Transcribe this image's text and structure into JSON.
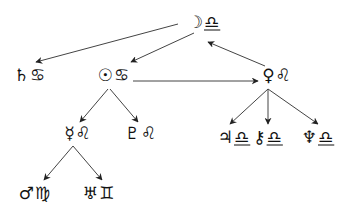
{
  "diagram": {
    "type": "astrological-dispositor-tree",
    "colors": {
      "line": "#444444",
      "glyph": "#111111",
      "background": "#ffffff"
    },
    "nodes": [
      {
        "id": "moon-libra",
        "planet": "☽",
        "planet_name": "Moon",
        "sign": "♎",
        "sign_name": "Libra",
        "x": 204,
        "y": 22,
        "underline": true
      },
      {
        "id": "saturn-cancer",
        "planet": "♄",
        "planet_name": "Saturn",
        "sign": "♋",
        "sign_name": "Cancer",
        "x": 30,
        "y": 75,
        "underline": false
      },
      {
        "id": "sun-cancer",
        "planet": "☉",
        "planet_name": "Sun",
        "sign": "♋",
        "sign_name": "Cancer",
        "x": 114,
        "y": 75,
        "underline": false
      },
      {
        "id": "venus-leo",
        "planet": "♀",
        "planet_name": "Venus",
        "sign": "♌",
        "sign_name": "Leo",
        "x": 277,
        "y": 75,
        "underline": false
      },
      {
        "id": "mercury-leo",
        "planet": "☿",
        "planet_name": "Mercury",
        "sign": "♌",
        "sign_name": "Leo",
        "x": 78,
        "y": 133,
        "underline": false
      },
      {
        "id": "pluto-leo",
        "planet": "♇",
        "planet_name": "Pluto",
        "sign": "♌",
        "sign_name": "Leo",
        "x": 141,
        "y": 133,
        "underline": false
      },
      {
        "id": "jupiter-libra",
        "planet": "♃",
        "planet_name": "Jupiter",
        "sign": "♎",
        "sign_name": "Libra",
        "x": 234,
        "y": 137,
        "underline": true
      },
      {
        "id": "chiron-libra",
        "planet": "⚷",
        "planet_name": "Chiron",
        "sign": "♎",
        "sign_name": "Libra",
        "x": 268,
        "y": 137,
        "underline": true
      },
      {
        "id": "neptune-libra",
        "planet": "♆",
        "planet_name": "Neptune",
        "sign": "♎",
        "sign_name": "Libra",
        "x": 318,
        "y": 137,
        "underline": true
      },
      {
        "id": "mars-virgo",
        "planet": "♂",
        "planet_name": "Mars",
        "sign": "♍",
        "sign_name": "Virgo",
        "x": 35,
        "y": 193,
        "underline": false
      },
      {
        "id": "uranus-gemini",
        "planet": "♅",
        "planet_name": "Uranus",
        "sign": "♊",
        "sign_name": "Gemini",
        "x": 99,
        "y": 193,
        "underline": false
      }
    ],
    "edges": [
      {
        "from": "moon-libra",
        "to": "saturn-cancer",
        "x1": 178,
        "y1": 24,
        "x2": 36,
        "y2": 62
      },
      {
        "from": "moon-libra",
        "to": "sun-cancer",
        "x1": 194,
        "y1": 33,
        "x2": 131,
        "y2": 62
      },
      {
        "from": "venus-leo",
        "to": "moon-libra",
        "x1": 265,
        "y1": 66,
        "x2": 208,
        "y2": 42
      },
      {
        "from": "sun-cancer",
        "to": "venus-leo",
        "x1": 133,
        "y1": 81,
        "x2": 258,
        "y2": 81
      },
      {
        "from": "sun-cancer",
        "to": "mercury-leo",
        "x1": 108,
        "y1": 89,
        "x2": 80,
        "y2": 122
      },
      {
        "from": "sun-cancer",
        "to": "pluto-leo",
        "x1": 110,
        "y1": 89,
        "x2": 138,
        "y2": 122
      },
      {
        "from": "venus-leo",
        "to": "jupiter-libra",
        "x1": 268,
        "y1": 89,
        "x2": 230,
        "y2": 124
      },
      {
        "from": "venus-leo",
        "to": "chiron-libra",
        "x1": 268,
        "y1": 89,
        "x2": 268,
        "y2": 124
      },
      {
        "from": "venus-leo",
        "to": "neptune-libra",
        "x1": 268,
        "y1": 89,
        "x2": 318,
        "y2": 124
      },
      {
        "from": "mercury-leo",
        "to": "mars-virgo",
        "x1": 73,
        "y1": 146,
        "x2": 44,
        "y2": 180
      },
      {
        "from": "mercury-leo",
        "to": "uranus-gemini",
        "x1": 73,
        "y1": 146,
        "x2": 102,
        "y2": 180
      }
    ]
  }
}
